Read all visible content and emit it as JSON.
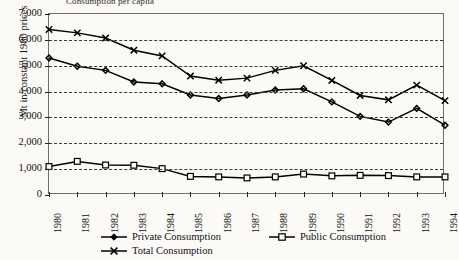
{
  "title_partial": "Consumption per capita",
  "axes": {
    "ylabel": "Mt in constant 1980 prices",
    "yticks": [
      "7,000",
      "6,000",
      "5,000",
      "4,000",
      "3,000",
      "2,000",
      "1,000",
      "0"
    ],
    "xticks": [
      "1980",
      "1981",
      "1982",
      "1983",
      "1984",
      "1985",
      "1986",
      "1987",
      "1988",
      "1989",
      "1990",
      "1991",
      "1992",
      "1993",
      "1994"
    ]
  },
  "legend": {
    "items": [
      {
        "label": "Private Consumption",
        "marker": "filled-diamond-marker"
      },
      {
        "label": "Public Consumption",
        "marker": "open-square-marker"
      },
      {
        "label": "Total Consumption",
        "marker": "cross-x-marker"
      }
    ]
  },
  "chart_data": {
    "type": "line",
    "title": "Consumption per capita",
    "xlabel": "",
    "ylabel": "Mt in constant 1980 prices",
    "ylim": [
      0,
      7000
    ],
    "ytick_step": 1000,
    "grid": true,
    "legend_position": "bottom",
    "categories": [
      "1980",
      "1981",
      "1982",
      "1983",
      "1984",
      "1985",
      "1986",
      "1987",
      "1988",
      "1989",
      "1990",
      "1991",
      "1992",
      "1993",
      "1994"
    ],
    "series": [
      {
        "name": "Private Consumption",
        "marker": "filled-diamond",
        "values": [
          5300,
          4980,
          4820,
          4370,
          4300,
          3870,
          3730,
          3870,
          4060,
          4110,
          3600,
          3040,
          2820,
          3350,
          2700
        ]
      },
      {
        "name": "Public Consumption",
        "marker": "open-square",
        "values": [
          1100,
          1300,
          1160,
          1150,
          1020,
          720,
          700,
          660,
          700,
          810,
          740,
          760,
          750,
          700,
          700
        ]
      },
      {
        "name": "Total Consumption",
        "marker": "cross-x",
        "values": [
          6400,
          6270,
          6070,
          5600,
          5380,
          4600,
          4440,
          4520,
          4820,
          5000,
          4430,
          3850,
          3680,
          4250,
          3650
        ]
      }
    ]
  }
}
